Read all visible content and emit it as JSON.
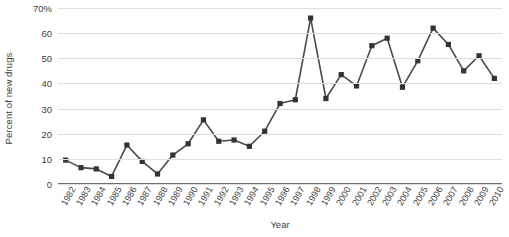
{
  "chart_data": {
    "type": "line",
    "title": "",
    "xlabel": "Year",
    "ylabel": "Percent of new drugs",
    "ylim": [
      0,
      70
    ],
    "yticks": [
      0,
      10,
      20,
      30,
      40,
      50,
      60,
      70
    ],
    "ytick_labels": [
      "0",
      "10",
      "20",
      "30",
      "40",
      "50",
      "60",
      "70%"
    ],
    "grid": true,
    "legend": "none",
    "marker": "square",
    "line_color": "#4a4a4a",
    "marker_color": "#333333",
    "grid_color": "#dedede",
    "axis_color": "#6e6e6e",
    "categories": [
      "1982",
      "1983",
      "1984",
      "1985",
      "1986",
      "1987",
      "1988",
      "1989",
      "1990",
      "1991",
      "1992",
      "1993",
      "1994",
      "1995",
      "1996",
      "1997",
      "1998",
      "1999",
      "2000",
      "2001",
      "2002",
      "2003",
      "2004",
      "2005",
      "2006",
      "2007",
      "2008",
      "2009",
      "2010"
    ],
    "values": [
      9.5,
      6.5,
      6,
      3,
      15.5,
      9,
      4,
      11.5,
      16,
      25.5,
      17,
      17.5,
      15,
      21,
      32,
      33.5,
      66,
      34,
      43.5,
      39,
      55,
      58,
      38.5,
      49,
      62,
      55.5,
      45,
      51,
      42
    ]
  }
}
